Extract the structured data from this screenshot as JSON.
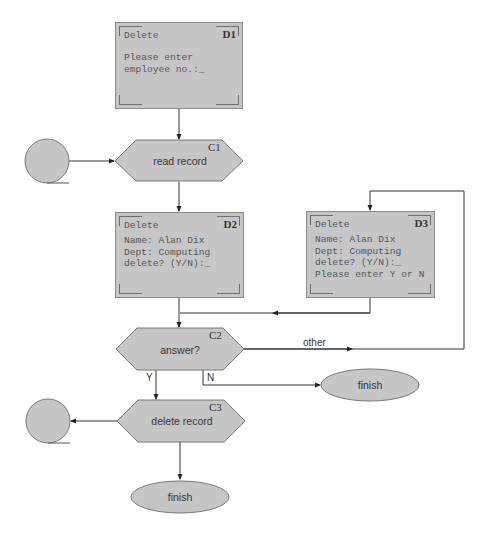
{
  "diagram": {
    "type": "flowchart",
    "screens": [
      {
        "id": "D1",
        "title": "Delete",
        "lines": [
          "Please enter",
          "employee no.:_"
        ]
      },
      {
        "id": "D2",
        "title": "Delete",
        "lines": [
          "Name: Alan Dix",
          "Dept: Computing",
          "delete? (Y/N):_"
        ]
      },
      {
        "id": "D3",
        "title": "Delete",
        "lines": [
          "Name: Alan Dix",
          "Dept: Computing",
          "delete? (Y/N):_",
          "Please enter Y or N"
        ]
      }
    ],
    "processes": [
      {
        "id": "C1",
        "label": "read record"
      },
      {
        "id": "C2",
        "label": "answer?"
      },
      {
        "id": "C3",
        "label": "delete record"
      }
    ],
    "terminals": [
      {
        "label": "finish"
      },
      {
        "label": "finish"
      }
    ],
    "edge_labels": {
      "other": "other",
      "yes": "Y",
      "no": "N"
    },
    "colors": {
      "fill": "#c6c6c6",
      "stroke": "#333333",
      "border": "#8a8a8a"
    }
  }
}
